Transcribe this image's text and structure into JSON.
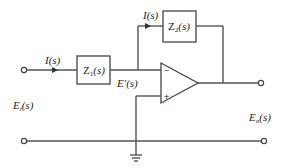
{
  "diagram": {
    "type": "inverting op-amp circuit with impedances",
    "labels": {
      "input_current": "I(s)",
      "feedback_current": "I(s)",
      "z1": "Z",
      "z1_sub": "1",
      "z1_tail": "(s)",
      "z2": "Z",
      "z2_sub": "2",
      "z2_tail": "(s)",
      "node_voltage": "E′(s)",
      "input_voltage": "E",
      "input_voltage_sub": "i",
      "input_voltage_tail": "(s)",
      "output_voltage": "E",
      "output_voltage_sub": "o",
      "output_voltage_tail": "(s)",
      "inverting_input": "−",
      "noninverting_input": "+"
    },
    "components": [
      {
        "id": "Z1",
        "kind": "impedance",
        "position": "series input"
      },
      {
        "id": "Z2",
        "kind": "impedance",
        "position": "feedback"
      },
      {
        "id": "opamp",
        "kind": "operational-amplifier"
      },
      {
        "id": "ground",
        "kind": "ground"
      }
    ],
    "colors": {
      "wire": "#555555",
      "background": "#ffffff",
      "text": "#222222"
    }
  }
}
